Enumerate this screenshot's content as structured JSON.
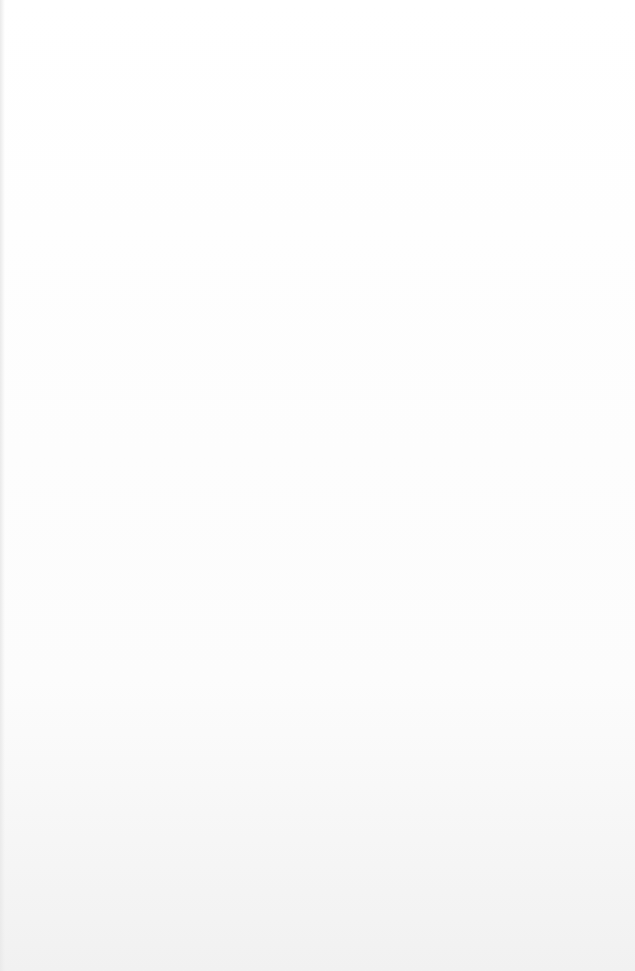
{
  "paper": {
    "type": "ruled notebook paper",
    "line_count": 24,
    "line_color": "#9c9c9c",
    "background_color": "#fdfdfd"
  }
}
